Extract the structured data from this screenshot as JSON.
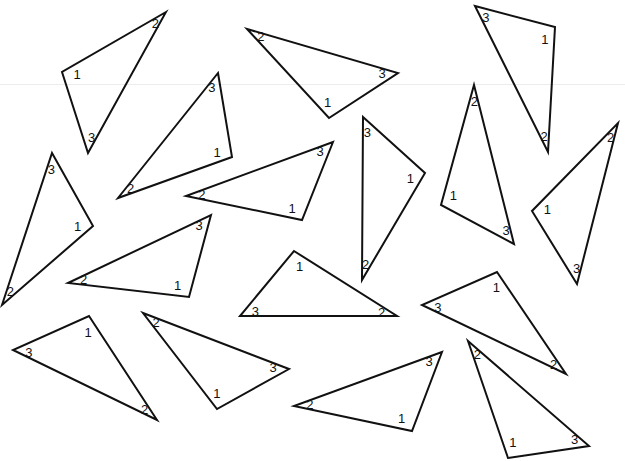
{
  "figure": {
    "stroke_color": "#111111",
    "background": "#ffffff",
    "rule_color": "#ececec"
  },
  "triangles": [
    {
      "id": "t1",
      "vertices": [
        [
          166,
          12
        ],
        [
          62,
          72
        ],
        [
          88,
          153
        ]
      ],
      "labels": [
        "2",
        "1",
        "3"
      ]
    },
    {
      "id": "t2",
      "vertices": [
        [
          247,
          29
        ],
        [
          398,
          73
        ],
        [
          329,
          118
        ]
      ],
      "labels": [
        "2",
        "3",
        "1"
      ]
    },
    {
      "id": "t3",
      "vertices": [
        [
          475,
          6
        ],
        [
          555,
          27
        ],
        [
          548,
          152
        ]
      ],
      "labels": [
        "3",
        "1",
        "2"
      ]
    },
    {
      "id": "t4",
      "vertices": [
        [
          218,
          73
        ],
        [
          232,
          157
        ],
        [
          118,
          198
        ]
      ],
      "labels": [
        "3",
        "1",
        "2"
      ]
    },
    {
      "id": "t5",
      "vertices": [
        [
          52,
          153
        ],
        [
          93,
          226
        ],
        [
          2,
          305
        ]
      ],
      "labels": [
        "3",
        "1",
        "2"
      ]
    },
    {
      "id": "t6",
      "vertices": [
        [
          333,
          142
        ],
        [
          302,
          220
        ],
        [
          186,
          196
        ]
      ],
      "labels": [
        "3",
        "1",
        "2"
      ]
    },
    {
      "id": "t7",
      "vertices": [
        [
          363,
          117
        ],
        [
          425,
          173
        ],
        [
          362,
          280
        ]
      ],
      "labels": [
        "3",
        "1",
        "2"
      ]
    },
    {
      "id": "t8",
      "vertices": [
        [
          474,
          85
        ],
        [
          514,
          244
        ],
        [
          441,
          205
        ]
      ],
      "labels": [
        "2",
        "3",
        "1"
      ]
    },
    {
      "id": "t9",
      "vertices": [
        [
          618,
          123
        ],
        [
          577,
          284
        ],
        [
          532,
          211
        ]
      ],
      "labels": [
        "2",
        "3",
        "1"
      ]
    },
    {
      "id": "t10",
      "vertices": [
        [
          211,
          215
        ],
        [
          189,
          297
        ],
        [
          68,
          283
        ]
      ],
      "labels": [
        "3",
        "1",
        "2"
      ]
    },
    {
      "id": "t11",
      "vertices": [
        [
          294,
          251
        ],
        [
          397,
          316
        ],
        [
          240,
          316
        ]
      ],
      "labels": [
        "1",
        "2",
        "3"
      ]
    },
    {
      "id": "t12",
      "vertices": [
        [
          497,
          272
        ],
        [
          566,
          374
        ],
        [
          422,
          305
        ]
      ],
      "labels": [
        "1",
        "2",
        "3"
      ]
    },
    {
      "id": "t13",
      "vertices": [
        [
          89,
          316
        ],
        [
          157,
          420
        ],
        [
          13,
          350
        ]
      ],
      "labels": [
        "1",
        "2",
        "3"
      ]
    },
    {
      "id": "t14",
      "vertices": [
        [
          143,
          313
        ],
        [
          289,
          369
        ],
        [
          217,
          409
        ]
      ],
      "labels": [
        "2",
        "3",
        "1"
      ]
    },
    {
      "id": "t15",
      "vertices": [
        [
          442,
          352
        ],
        [
          412,
          431
        ],
        [
          294,
          406
        ]
      ],
      "labels": [
        "3",
        "1",
        "2"
      ]
    },
    {
      "id": "t16",
      "vertices": [
        [
          468,
          341
        ],
        [
          589,
          446
        ],
        [
          508,
          458
        ]
      ],
      "labels": [
        "2",
        "3",
        "1"
      ]
    }
  ]
}
